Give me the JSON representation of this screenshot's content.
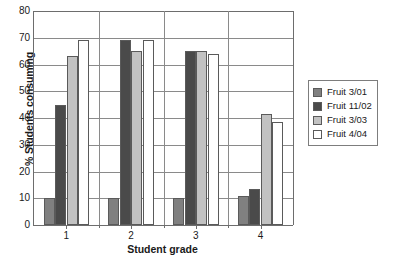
{
  "chart_data": {
    "type": "bar",
    "title": "",
    "xlabel": "Student grade",
    "ylabel": "% Students consuming",
    "categories": [
      "1",
      "2",
      "3",
      "4"
    ],
    "ylim": [
      0,
      80
    ],
    "yticks": [
      0,
      10,
      20,
      30,
      40,
      50,
      60,
      70,
      80
    ],
    "grid": true,
    "legend_position": "right",
    "series": [
      {
        "name": "Fruit 3/01",
        "color": "#808080",
        "values": [
          10,
          10,
          10,
          11
        ]
      },
      {
        "name": "Fruit 11/02",
        "color": "#4a4a4a",
        "values": [
          45,
          69,
          65,
          13.5
        ]
      },
      {
        "name": "Fruit 3/03",
        "color": "#c2c2c2",
        "values": [
          63,
          65,
          65,
          41.5
        ]
      },
      {
        "name": "Fruit 4/04",
        "color": "#ffffff",
        "values": [
          69,
          69,
          64,
          38.5
        ]
      }
    ]
  },
  "axes": {
    "ylabel": "% Students consuming",
    "xlabel": "Student grade",
    "ytick_labels": [
      "0",
      "10",
      "20",
      "30",
      "40",
      "50",
      "60",
      "70",
      "80"
    ],
    "xtick_labels": [
      "1",
      "2",
      "3",
      "4"
    ]
  },
  "legend": {
    "items": [
      {
        "label": "Fruit 3/01",
        "color": "#808080"
      },
      {
        "label": "Fruit 11/02",
        "color": "#4a4a4a"
      },
      {
        "label": "Fruit 3/03",
        "color": "#c2c2c2"
      },
      {
        "label": "Fruit 4/04",
        "color": "#ffffff"
      }
    ]
  }
}
